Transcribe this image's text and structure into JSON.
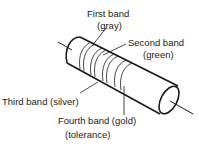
{
  "diagram": {
    "labels": {
      "first_band": "First band",
      "first_band_color": "(gray)",
      "second_band": "Second band",
      "second_band_color": "(green)",
      "third_band": "Third band (silver)",
      "fourth_band": "Fourth band (gold)",
      "fourth_band_note": "(tolerance)"
    },
    "colors": {
      "stroke": "#1a1a1a",
      "background": "#ffffff"
    }
  }
}
